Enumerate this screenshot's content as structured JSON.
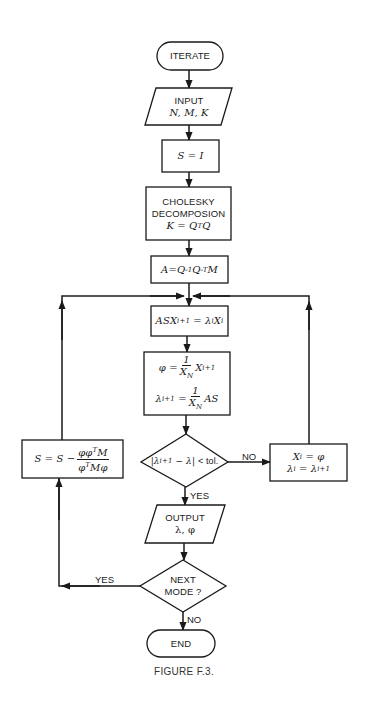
{
  "diagram": {
    "type": "flowchart",
    "caption": "FIGURE F.3.",
    "nodes": {
      "start": {
        "shape": "terminator",
        "label": "ITERATE"
      },
      "input": {
        "shape": "parallelogram",
        "title": "INPUT",
        "vars": "N, M, K"
      },
      "init": {
        "shape": "process",
        "expr": "S = I"
      },
      "cholesky": {
        "shape": "process",
        "line1": "CHOLESKY",
        "line2": "DECOMPOSION",
        "expr": "K = QᵀQ"
      },
      "a_matrix": {
        "shape": "process",
        "expr": "A = Q⁻¹Q⁻ᵀM"
      },
      "solve": {
        "shape": "process",
        "expr": "ASXᵢ₊₁ = λᵢXᵢ"
      },
      "normalize": {
        "shape": "process",
        "expr1": "φ = (1/X_N) Xᵢ₊₁",
        "expr2": "λᵢ₊₁ = (1/X_N) AS"
      },
      "convergence": {
        "shape": "decision",
        "expr": "|λᵢ₊₁ − λ| < tol."
      },
      "update": {
        "shape": "process",
        "expr1": "Xᵢ = φ",
        "expr2": "λᵢ = λᵢ₊₁"
      },
      "output": {
        "shape": "parallelogram",
        "title": "OUTPUT",
        "vars": "λ, φ"
      },
      "next_mode": {
        "shape": "decision",
        "line1": "NEXT",
        "line2": "MODE ?"
      },
      "deflate": {
        "shape": "process",
        "expr": "S = S − φφᵀM / φᵀMφ"
      },
      "end": {
        "shape": "terminator",
        "label": "END"
      }
    },
    "edge_labels": {
      "convergence_no": "NO",
      "convergence_yes": "YES",
      "next_mode_yes": "YES",
      "next_mode_no": "NO"
    },
    "edges": [
      {
        "from": "start",
        "to": "input"
      },
      {
        "from": "input",
        "to": "init"
      },
      {
        "from": "init",
        "to": "cholesky"
      },
      {
        "from": "cholesky",
        "to": "a_matrix"
      },
      {
        "from": "a_matrix",
        "to": "solve"
      },
      {
        "from": "solve",
        "to": "normalize"
      },
      {
        "from": "normalize",
        "to": "convergence"
      },
      {
        "from": "convergence",
        "to": "update",
        "label": "NO"
      },
      {
        "from": "update",
        "to": "solve"
      },
      {
        "from": "convergence",
        "to": "output",
        "label": "YES"
      },
      {
        "from": "output",
        "to": "next_mode"
      },
      {
        "from": "next_mode",
        "to": "deflate",
        "label": "YES"
      },
      {
        "from": "deflate",
        "to": "solve"
      },
      {
        "from": "next_mode",
        "to": "end",
        "label": "NO"
      }
    ],
    "math": {
      "S": "S",
      "I": "I",
      "K": "K",
      "Q": "Q",
      "T": "T",
      "neg1": "-1",
      "negT": "-T",
      "A": "A",
      "M": "M",
      "AS": "AS",
      "X": "X",
      "i1": "i+1",
      "i": "i",
      "N": "N",
      "lambda": "λ",
      "phi": "φ",
      "one": "1",
      "eq": "=",
      "minus": "−",
      "tol": "< tol.",
      "phiphi": "φφ",
      "Mphi": "Mφ",
      "lt": "<"
    }
  }
}
